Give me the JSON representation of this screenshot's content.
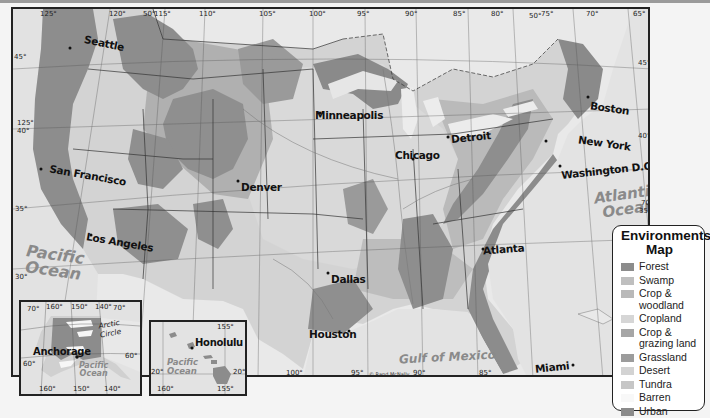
{
  "map": {
    "title": "Environments Map",
    "colors": {
      "forest": "#8c8c8c",
      "swamp": "#bdbdbd",
      "crop_woodland": "#b6b6b6",
      "cropland": "#d6d6d6",
      "crop_grazing": "#a3a3a3",
      "grassland": "#9a9a9a",
      "desert": "#d2d2d2",
      "tundra": "#c4c4c4",
      "barren": "#f7f7f7",
      "urban": "#8a8a8a",
      "water": "#e8e8e8",
      "canada": "#ededed"
    },
    "cities": [
      {
        "name": "Seattle"
      },
      {
        "name": "San Francisco"
      },
      {
        "name": "Los Angeles"
      },
      {
        "name": "Denver"
      },
      {
        "name": "Minneapolis"
      },
      {
        "name": "Chicago"
      },
      {
        "name": "Detroit"
      },
      {
        "name": "Boston"
      },
      {
        "name": "New York"
      },
      {
        "name": "Washington D.C."
      },
      {
        "name": "Atlanta"
      },
      {
        "name": "Dallas"
      },
      {
        "name": "Houston"
      },
      {
        "name": "Miami"
      }
    ],
    "water_labels": {
      "pacific": "Pacific Ocean",
      "pacific_line1": "Pacific",
      "pacific_line2": "Ocean",
      "atlantic_line1": "Atlantic",
      "atlantic_line2": "Ocean",
      "gulf": "Gulf of Mexico"
    },
    "longitude_top": [
      "125°",
      "120°",
      "50°",
      "115°",
      "110°",
      "105°",
      "100°",
      "95°",
      "90°",
      "85°",
      "80°",
      "50°",
      "75°",
      "70°",
      "65°"
    ],
    "longitude_bottom": [
      "100°",
      "95°",
      "90°",
      "85°"
    ],
    "latitude_left": [
      "45°",
      "125°",
      "40°",
      "35°",
      "30°"
    ],
    "latitude_right": [
      "45°",
      "40°",
      "70°",
      "35°"
    ],
    "copyright": "© Rand McNally"
  },
  "alaska_inset": {
    "city": "Anchorage",
    "label_arctic": "Arctic Circle",
    "ocean_line1": "Pacific",
    "ocean_line2": "Ocean",
    "top_coords": [
      "70°",
      "160°",
      "150°",
      "140°",
      "70°"
    ],
    "bottom_coords": [
      "160°",
      "150°",
      "140°"
    ],
    "side_left": "60°",
    "side_right": "60°"
  },
  "hawaii_inset": {
    "city": "Honolulu",
    "ocean_line1": "Pacific",
    "ocean_line2": "Ocean",
    "top_coord": "155°",
    "bottom_coords": [
      "160°",
      "155°"
    ],
    "left_coord": "20°",
    "right_coord": "20°"
  },
  "legend": {
    "title_line1": "Environments",
    "title_line2": "Map",
    "items": [
      {
        "label": "Forest",
        "color": "#8c8c8c"
      },
      {
        "label": "Swamp",
        "color": "#bfbfbf"
      },
      {
        "label": "Crop & woodland",
        "line1": "Crop &",
        "line2": "woodland",
        "color": "#b9b9b9"
      },
      {
        "label": "Cropland",
        "color": "#d6d6d6"
      },
      {
        "label": "Crop & grazing land",
        "line1": "Crop &",
        "line2": "grazing land",
        "color": "#a6a6a6"
      },
      {
        "label": "Grassland",
        "color": "#9c9c9c"
      },
      {
        "label": "Desert",
        "color": "#d3d3d3"
      },
      {
        "label": "Tundra",
        "color": "#c6c6c6"
      },
      {
        "label": "Barren",
        "color": "#f8f8f8"
      },
      {
        "label": "Urban",
        "color": "#8b8b8b"
      }
    ]
  }
}
